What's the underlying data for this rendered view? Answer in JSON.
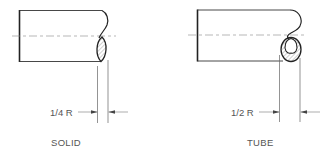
{
  "figures": [
    {
      "id": "solid",
      "title": "SOLID",
      "dimension_label": "1/4 R"
    },
    {
      "id": "tube",
      "title": "TUBE",
      "dimension_label": "1/2 R"
    }
  ],
  "colors": {
    "outline": "#222222",
    "thin": "#777777",
    "text": "#555555",
    "background": "#ffffff"
  }
}
